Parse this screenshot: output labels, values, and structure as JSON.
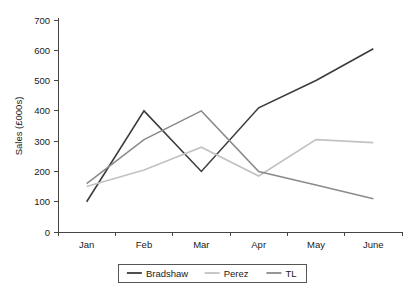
{
  "chart_data": {
    "type": "line",
    "title": "",
    "xlabel": "",
    "ylabel": "Sales (£000s)",
    "categories": [
      "Jan",
      "Feb",
      "Mar",
      "Apr",
      "May",
      "June"
    ],
    "ylim": [
      0,
      700
    ],
    "ytick_values": [
      0,
      100,
      200,
      300,
      400,
      500,
      600,
      700
    ],
    "ytick_labels": [
      "0",
      "100",
      "200",
      "300",
      "400",
      "500",
      "600",
      "700"
    ],
    "grid": false,
    "legend_position": "bottom",
    "series": [
      {
        "name": "Bradshaw",
        "color": "#3c3c3c",
        "values": [
          100,
          400,
          200,
          410,
          500,
          605
        ]
      },
      {
        "name": "Perez",
        "color": "#c2c2c2",
        "values": [
          150,
          205,
          280,
          185,
          305,
          295
        ]
      },
      {
        "name": "TL",
        "color": "#8b8b8b",
        "values": [
          160,
          305,
          400,
          200,
          155,
          110
        ]
      }
    ]
  },
  "axes": {
    "y_axis_title": "Sales (£000s)",
    "x_tick_labels": [
      "Jan",
      "Feb",
      "Mar",
      "Apr",
      "May",
      "June"
    ],
    "y_tick_labels": [
      "700",
      "600",
      "500",
      "400",
      "300",
      "200",
      "100",
      "0"
    ]
  },
  "legend": {
    "entries": [
      {
        "label": "Bradshaw",
        "color": "#3c3c3c"
      },
      {
        "label": "Perez",
        "color": "#c2c2c2"
      },
      {
        "label": "TL",
        "color": "#8b8b8b"
      }
    ]
  }
}
